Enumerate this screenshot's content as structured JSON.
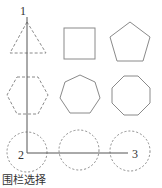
{
  "labels": {
    "point1": "1",
    "point2": "2",
    "point3": "3"
  },
  "caption": "围栏选择",
  "colors": {
    "shape_stroke": "#8a8a8a",
    "fence_line": "#555555",
    "text": "#333333"
  },
  "shapes": [
    {
      "name": "triangle",
      "sides": 3,
      "style": "dashed",
      "selected": true
    },
    {
      "name": "square",
      "sides": 4,
      "style": "solid",
      "selected": false
    },
    {
      "name": "pentagon",
      "sides": 5,
      "style": "solid",
      "selected": false
    },
    {
      "name": "hexagon",
      "sides": 6,
      "style": "dashed",
      "selected": true
    },
    {
      "name": "heptagon",
      "sides": 7,
      "style": "solid",
      "selected": false
    },
    {
      "name": "octagon",
      "sides": 8,
      "style": "solid",
      "selected": false
    },
    {
      "name": "circle-left",
      "sides": 0,
      "style": "dashed",
      "selected": true
    },
    {
      "name": "circle-middle",
      "sides": 0,
      "style": "dashed",
      "selected": true
    },
    {
      "name": "circle-right",
      "sides": 0,
      "style": "dashed",
      "selected": true
    }
  ]
}
